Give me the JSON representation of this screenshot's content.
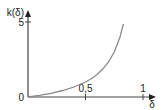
{
  "chart_data": {
    "type": "line",
    "title": "",
    "xlabel": "δ",
    "ylabel": "k(δ)",
    "xlim": [
      0,
      1.1
    ],
    "ylim": [
      0,
      5.8
    ],
    "grid": false,
    "x_ticks": [
      {
        "value": 0.5,
        "label": "0,5"
      },
      {
        "value": 1,
        "label": "1"
      }
    ],
    "y_ticks": [
      {
        "value": 5,
        "label": "5"
      }
    ],
    "origin_label": "0",
    "series": [
      {
        "name": "k(δ)",
        "x": [
          0,
          0.1,
          0.2,
          0.3,
          0.4,
          0.5,
          0.55,
          0.6,
          0.65,
          0.7,
          0.75,
          0.8,
          0.83
        ],
        "values": [
          0,
          0.11,
          0.25,
          0.43,
          0.67,
          1.0,
          1.22,
          1.5,
          1.86,
          2.33,
          3.0,
          4.0,
          4.88
        ]
      }
    ],
    "colors": {
      "axis": "#444444",
      "curve": "#8a8a8a"
    }
  }
}
